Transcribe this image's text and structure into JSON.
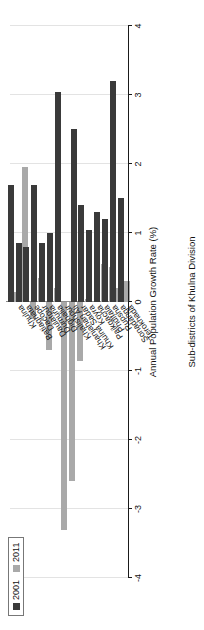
{
  "chart_data": {
    "type": "bar",
    "title": "",
    "orientation": "vertical-bars-rotated",
    "xlabel": "Sub-districts of Khulna Division",
    "ylabel": "Annual Population Growth Rate (%)",
    "ylim": [
      -4,
      4
    ],
    "yticks": [
      4,
      3,
      2,
      1,
      0,
      -1,
      -2,
      -3,
      -4
    ],
    "ytick_labels": [
      "4",
      "3",
      "2",
      "1",
      "0",
      "-1",
      "-2",
      "-3",
      "-4"
    ],
    "grid": true,
    "legend_position": "top-right",
    "categories": [
      "Khulna",
      "Batiaghata",
      "Dacope",
      "Daulatpur",
      "Dumuria",
      "Dighalia",
      "Khalishpur",
      "Khanjahan Ali",
      "Khulna Sadar",
      "Koyra",
      "Paikgacha",
      "Phultala",
      "Rupsha",
      "Sonadanga",
      "Terokhada"
    ],
    "series": [
      {
        "name": "2001",
        "color": "#3a3a3a",
        "values": [
          1.7,
          0.85,
          0.8,
          1.7,
          0.85,
          1.0,
          3.05,
          0.0,
          2.5,
          1.4,
          1.05,
          1.3,
          1.2,
          3.2,
          1.5
        ]
      },
      {
        "name": "2011",
        "color": "#a9a9a9",
        "values": [
          0.15,
          1.95,
          -0.25,
          0.35,
          -0.7,
          0.2,
          -3.3,
          -2.6,
          -0.85,
          0.05,
          0.0,
          0.55,
          0.5,
          0.2,
          0.3
        ]
      }
    ]
  },
  "legend": {
    "entries": [
      {
        "label": "2001",
        "color": "#3a3a3a"
      },
      {
        "label": "2011",
        "color": "#a9a9a9"
      }
    ]
  }
}
